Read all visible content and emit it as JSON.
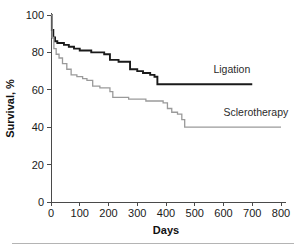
{
  "figure": {
    "background_color": "#ffffff",
    "footer_rule_color": "#b4b4b4"
  },
  "chart_data": {
    "type": "line",
    "title": "",
    "subtitle": "",
    "xlabel": "Days",
    "ylabel": "Survival, %",
    "xlim": [
      0,
      800
    ],
    "ylim": [
      0,
      100
    ],
    "xticks": [
      0,
      100,
      200,
      300,
      400,
      500,
      600,
      700,
      800
    ],
    "xtick_labels": [
      "0",
      "100",
      "200",
      "300",
      "400",
      "500",
      "600",
      "700",
      "800"
    ],
    "yticks": [
      0,
      20,
      40,
      60,
      80,
      100
    ],
    "ytick_labels": [
      "0",
      "20",
      "40",
      "60",
      "80",
      "100"
    ],
    "grid": false,
    "legend_position": "inline-right",
    "step_style": "post",
    "series": [
      {
        "name": "Ligation",
        "color": "#1a1a1a",
        "stroke_width": 1.9,
        "label_x": 565,
        "label_y": 69,
        "x": [
          0,
          3,
          8,
          14,
          22,
          30,
          45,
          62,
          80,
          100,
          120,
          140,
          165,
          185,
          205,
          235,
          265,
          275,
          300,
          320,
          345,
          360,
          370,
          700
        ],
        "y": [
          100,
          92,
          88,
          86,
          85,
          85,
          84,
          83,
          82,
          81,
          81,
          80,
          80,
          79,
          76,
          75,
          75,
          71,
          70,
          69,
          68,
          67,
          63,
          63
        ]
      },
      {
        "name": "Sclerotherapy",
        "color": "#9a9a9a",
        "stroke_width": 1.3,
        "label_x": 600,
        "label_y": 46,
        "x": [
          0,
          4,
          10,
          18,
          28,
          40,
          55,
          70,
          90,
          110,
          125,
          145,
          170,
          195,
          205,
          215,
          240,
          270,
          300,
          330,
          360,
          390,
          405,
          420,
          440,
          455,
          465,
          800
        ],
        "y": [
          100,
          88,
          82,
          79,
          77,
          74,
          71,
          68,
          67,
          66,
          65,
          62,
          61,
          61,
          59,
          56,
          56,
          55,
          55,
          54,
          54,
          53,
          50,
          48,
          47,
          44,
          40,
          40
        ]
      }
    ]
  }
}
